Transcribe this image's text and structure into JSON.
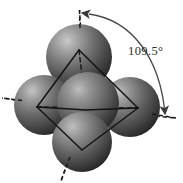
{
  "figure": {
    "name": "tetrahedral-molecular-geometry",
    "background_color": "#ffffff",
    "width": 183,
    "height": 183
  },
  "annotation": {
    "angle_label": "109.5°",
    "angle_value": 109.5,
    "angle_units": "degrees",
    "label_color": "#2b2b2b",
    "label_x": 128,
    "label_y": 55
  },
  "geometry": {
    "shape": "tetrahedron",
    "center_vertex": {
      "x": 86,
      "y": 110
    },
    "sphere_color_light": "#b9b9b9",
    "sphere_color_mid": "#6e6e6e",
    "sphere_color_dark": "#2e2e2e",
    "edge_color": "#1a1a1a",
    "axis_color": "#1a1a1a",
    "arc_color": "#4a4a4a"
  },
  "spheres": [
    {
      "label": "top-sphere",
      "cx": 79,
      "cy": 57,
      "r": 32
    },
    {
      "label": "left-sphere",
      "cx": 45,
      "cy": 105,
      "r": 30
    },
    {
      "label": "right-sphere",
      "cx": 129,
      "cy": 107,
      "r": 30
    },
    {
      "label": "bottom-sphere",
      "cx": 82,
      "cy": 142,
      "r": 30
    },
    {
      "label": "center-sphere",
      "cx": 88,
      "cy": 103,
      "r": 31
    }
  ],
  "tetrahedron_vertices": [
    {
      "label": "vertex-top",
      "x": 79,
      "y": 50
    },
    {
      "label": "vertex-left",
      "x": 37,
      "y": 107
    },
    {
      "label": "vertex-right",
      "x": 138,
      "y": 108
    },
    {
      "label": "vertex-bottom-front",
      "x": 82,
      "y": 148
    }
  ],
  "bond_axes": [
    {
      "label": "axis-up",
      "x1": 86,
      "y1": 110,
      "x2": 79,
      "y2": 9
    },
    {
      "label": "axis-left",
      "x1": 86,
      "y1": 110,
      "x2": 2,
      "y2": 98
    },
    {
      "label": "axis-right",
      "x1": 86,
      "y1": 110,
      "x2": 176,
      "y2": 118
    },
    {
      "label": "axis-down",
      "x1": 86,
      "y1": 110,
      "x2": 62,
      "y2": 180
    }
  ],
  "angle_arc": {
    "label": "angle-arc-double-arrow",
    "start": {
      "x": 88,
      "y": 14
    },
    "end": {
      "x": 166,
      "y": 118
    },
    "arrowhead_start": "left-pointing",
    "arrowhead_end": "down-right-pointing"
  }
}
